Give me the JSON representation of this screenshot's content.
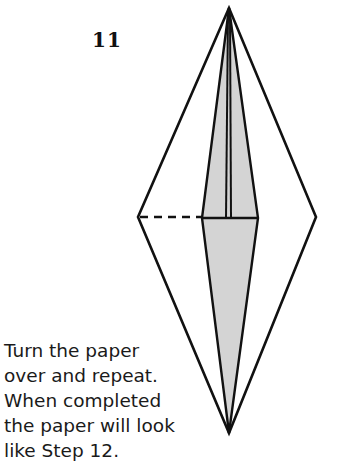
{
  "step": {
    "number": "11"
  },
  "instructions": {
    "lines": [
      "Turn the paper",
      "over and repeat.",
      "When completed",
      "the paper will look",
      "like Step 12."
    ]
  },
  "diagram": {
    "fill_color": "#d4d4d4",
    "line_color": "#111111"
  }
}
